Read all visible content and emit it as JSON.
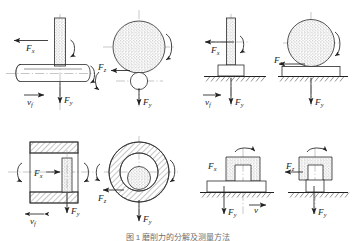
{
  "figure": {
    "caption": "图 1  磨削力的分解及测量方法",
    "colors": {
      "line": "#2b2b2b",
      "centerline": "#8d8d8d",
      "label": "#1b1b1b",
      "caption": "#6f6f6f",
      "background": "#ffffff"
    },
    "force_symbols": {
      "fx": "F",
      "fx_sub": "x",
      "fy": "F",
      "fy_sub": "y",
      "fz": "F",
      "fz_sub": "z",
      "vf": "v",
      "vf_sub": "f",
      "v": "v"
    },
    "panels": [
      {
        "id": "panel-a",
        "name": "external-cylindrical-grinding",
        "position": "top-left",
        "views": [
          {
            "id": "a-front",
            "name": "front-view",
            "elements": [
              "grinding-wheel-rectangle",
              "cylindrical-workpiece",
              "centerline",
              "rotation-arrow"
            ],
            "labels": [
              {
                "key": "fx",
                "base": "F",
                "sub": "x",
                "x": 26,
                "y": 50,
                "direction": "left"
              },
              {
                "key": "fy",
                "base": "F",
                "sub": "y",
                "x": 76,
                "y": 100,
                "direction": "down"
              },
              {
                "key": "vf",
                "base": "v",
                "sub": "f",
                "x": 29,
                "y": 102,
                "direction": "right"
              }
            ]
          },
          {
            "id": "a-end",
            "name": "end-view",
            "elements": [
              "wheel-circle-stippled",
              "workpiece-circle",
              "centerline",
              "rotation-arrows"
            ],
            "labels": [
              {
                "key": "fz",
                "base": "F",
                "sub": "z",
                "x": 101,
                "y": 70,
                "direction": "left"
              },
              {
                "key": "fy",
                "base": "F",
                "sub": "y",
                "x": 147,
                "y": 105,
                "direction": "down"
              }
            ]
          }
        ]
      },
      {
        "id": "panel-b",
        "name": "surface-grinding-peripheral",
        "position": "top-right",
        "views": [
          {
            "id": "b-front",
            "name": "front-view",
            "elements": [
              "grinding-wheel-rectangle",
              "workpiece-block",
              "hatched-ground",
              "rotation-arrow"
            ],
            "labels": [
              {
                "key": "fx",
                "base": "F",
                "sub": "x",
                "x": 213,
                "y": 52,
                "direction": "left"
              },
              {
                "key": "fy",
                "base": "F",
                "sub": "y",
                "x": 247,
                "y": 103,
                "direction": "down"
              },
              {
                "key": "vf",
                "base": "v",
                "sub": "f",
                "x": 207,
                "y": 103,
                "direction": "right"
              }
            ]
          },
          {
            "id": "b-side",
            "name": "side-view",
            "elements": [
              "wheel-circle-stippled",
              "table-block",
              "hatched-ground",
              "rotation-arrow"
            ],
            "labels": [
              {
                "key": "fz",
                "base": "F",
                "sub": "z",
                "x": 275,
                "y": 63,
                "direction": "left"
              },
              {
                "key": "fy",
                "base": "F",
                "sub": "y",
                "x": 320,
                "y": 103,
                "direction": "down"
              }
            ]
          }
        ]
      },
      {
        "id": "panel-c",
        "name": "internal-grinding",
        "position": "bottom-left",
        "views": [
          {
            "id": "c-section",
            "name": "section-view",
            "elements": [
              "hatched-hollow-workpiece",
              "grinding-wheel-stippled",
              "centerline",
              "rotation-arrows"
            ],
            "labels": [
              {
                "key": "fx",
                "base": "F",
                "sub": "x",
                "x": 38,
                "y": 174,
                "direction": "right"
              },
              {
                "key": "fy",
                "base": "F",
                "sub": "y",
                "x": 78,
                "y": 212,
                "direction": "down"
              },
              {
                "key": "vf",
                "base": "v",
                "sub": "f",
                "x": 36,
                "y": 222,
                "direction": "both"
              }
            ]
          },
          {
            "id": "c-end",
            "name": "end-view",
            "elements": [
              "hatched-annulus",
              "inner-wheel-circle-stippled",
              "centerline",
              "rotation-arrow"
            ],
            "labels": [
              {
                "key": "fz",
                "base": "F",
                "sub": "z",
                "x": 100,
                "y": 200,
                "direction": "left"
              },
              {
                "key": "fy",
                "base": "F",
                "sub": "y",
                "x": 147,
                "y": 220,
                "direction": "down"
              }
            ]
          }
        ]
      },
      {
        "id": "panel-d",
        "name": "face-grinding-vertical-spindle",
        "position": "bottom-right",
        "views": [
          {
            "id": "d-front",
            "name": "front-view",
            "elements": [
              "cup-wheel-stippled",
              "workpiece-block",
              "hatched-ground",
              "spindle-rotation-arrow"
            ],
            "labels": [
              {
                "key": "fx",
                "base": "F",
                "sub": "x",
                "x": 211,
                "y": 166,
                "direction": "none"
              },
              {
                "key": "fy",
                "base": "F",
                "sub": "y",
                "x": 228,
                "y": 215,
                "direction": "down"
              },
              {
                "key": "v",
                "base": "v",
                "sub": "",
                "x": 257,
                "y": 211,
                "direction": "right"
              }
            ]
          },
          {
            "id": "d-side",
            "name": "side-view",
            "elements": [
              "cup-wheel-stippled",
              "workpiece-block",
              "hatched-ground",
              "spindle-rotation-arrow"
            ],
            "labels": [
              {
                "key": "fz",
                "base": "F",
                "sub": "z",
                "x": 287,
                "y": 165,
                "direction": "left"
              },
              {
                "key": "fy",
                "base": "F",
                "sub": "y",
                "x": 318,
                "y": 215,
                "direction": "down"
              }
            ]
          }
        ]
      }
    ]
  }
}
